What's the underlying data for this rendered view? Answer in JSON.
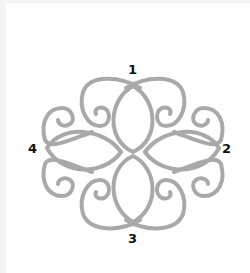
{
  "diagram": {
    "type": "ornamental-knot",
    "stroke_color": "#a9a9a9",
    "labels": [
      {
        "id": "1",
        "text": "1",
        "position": "top"
      },
      {
        "id": "2",
        "text": "2",
        "position": "right"
      },
      {
        "id": "3",
        "text": "3",
        "position": "bottom"
      },
      {
        "id": "4",
        "text": "4",
        "position": "left"
      }
    ]
  }
}
